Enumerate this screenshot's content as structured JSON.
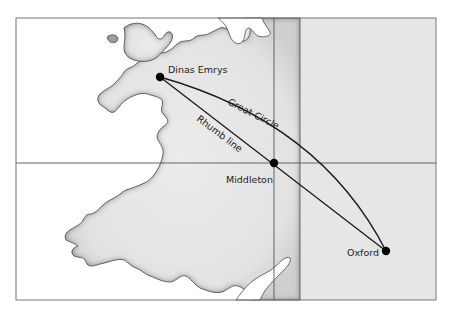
{
  "map": {
    "colors": {
      "sea": "#ffffff",
      "land": "#e6e6e6",
      "land_shadow": "#8a8a8a",
      "frame": "#777777",
      "route": "#1a1a1a",
      "dot": "#000000"
    },
    "places": [
      {
        "name": "Dinas Emrys",
        "x": 160,
        "y": 77
      },
      {
        "name": "Middleton",
        "x": 274,
        "y": 163
      },
      {
        "name": "Oxford",
        "x": 386,
        "y": 251
      }
    ],
    "routes": [
      {
        "name": "Great Circle",
        "label": "Great Circle"
      },
      {
        "name": "Rhumb line",
        "label": "Rhumb line"
      }
    ],
    "labels": {
      "dinas_emrys": "Dinas Emrys",
      "middleton": "Middleton",
      "oxford": "Oxford",
      "great_circle": "Great Circle",
      "rhumb_line": "Rhumb line"
    }
  }
}
